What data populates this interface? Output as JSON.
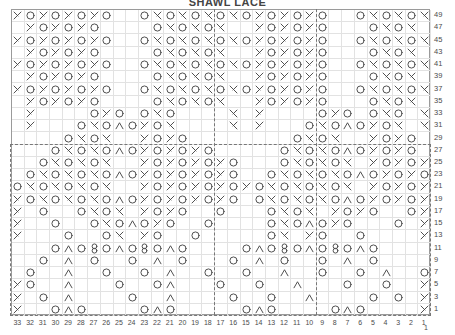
{
  "chart_title": "SHAWL LACE",
  "legend_symbols": {
    "yo": "o",
    "k2tog": "\\",
    "ssk": "/",
    "cdd": "^",
    "double-dec": "Q",
    "blank": ""
  },
  "axes": {
    "row_numbers": [
      49,
      47,
      45,
      43,
      41,
      39,
      37,
      35,
      33,
      31,
      29,
      27,
      25,
      23,
      21,
      19,
      17,
      15,
      13,
      11,
      9,
      7,
      5,
      3,
      1
    ],
    "column_numbers": [
      33,
      32,
      31,
      30,
      29,
      28,
      27,
      26,
      25,
      24,
      23,
      22,
      21,
      20,
      19,
      18,
      17,
      16,
      15,
      14,
      13,
      12,
      11,
      10,
      9,
      8,
      7,
      6,
      5,
      4,
      3,
      2,
      1
    ],
    "extra_label": "1",
    "row_count": 25,
    "column_count": 33
  },
  "chart_data": {
    "type": "table",
    "title": "SHAWL LACE",
    "xlabel": "Stitch number",
    "ylabel": "Row number",
    "grid": true,
    "legend_position": "none",
    "rows": [
      {
        "row": 49,
        "cells": [
          "/",
          "o",
          "/",
          "o",
          "/",
          "o",
          "/",
          "o",
          "",
          "",
          "o",
          "\\",
          "o",
          "\\",
          "o",
          "\\",
          "o",
          "\\",
          "o",
          "/",
          "o",
          "/",
          "o",
          "/",
          "o",
          "",
          "",
          "o",
          "\\",
          "o",
          "\\",
          "o",
          "\\"
        ]
      },
      {
        "row": 47,
        "cells": [
          "",
          "/",
          "o",
          "/",
          "o",
          "/",
          "o",
          "",
          "",
          "",
          "",
          "o",
          "\\",
          "o",
          "\\",
          "o",
          "\\",
          "",
          "",
          "/",
          "o",
          "/",
          "o",
          "/",
          "o",
          "",
          "",
          "",
          "o",
          "\\",
          "o",
          "\\",
          ""
        ]
      },
      {
        "row": 45,
        "cells": [
          "/",
          "o",
          "/",
          "o",
          "/",
          "o",
          "/",
          "o",
          "",
          "",
          "o",
          "\\",
          "o",
          "\\",
          "o",
          "\\",
          "o",
          "\\",
          "o",
          "/",
          "o",
          "/",
          "o",
          "/",
          "o",
          "",
          "",
          "o",
          "\\",
          "o",
          "\\",
          "o",
          "\\"
        ]
      },
      {
        "row": 43,
        "cells": [
          "",
          "/",
          "o",
          "/",
          "o",
          "/",
          "o",
          "",
          "",
          "",
          "",
          "o",
          "\\",
          "o",
          "\\",
          "o",
          "\\",
          "",
          "",
          "/",
          "o",
          "/",
          "o",
          "/",
          "o",
          "",
          "",
          "",
          "o",
          "\\",
          "o",
          "\\",
          ""
        ]
      },
      {
        "row": 41,
        "cells": [
          "/",
          "o",
          "/",
          "o",
          "/",
          "o",
          "/",
          "o",
          "",
          "",
          "o",
          "\\",
          "o",
          "\\",
          "o",
          "\\",
          "o",
          "\\",
          "o",
          "/",
          "o",
          "/",
          "o",
          "/",
          "o",
          "",
          "",
          "o",
          "\\",
          "o",
          "\\",
          "o",
          "\\"
        ]
      },
      {
        "row": 39,
        "cells": [
          "",
          "/",
          "o",
          "/",
          "o",
          "/",
          "o",
          "",
          "",
          "",
          "",
          "o",
          "\\",
          "o",
          "\\",
          "o",
          "\\",
          "",
          "",
          "/",
          "o",
          "/",
          "o",
          "/",
          "o",
          "",
          "",
          "",
          "o",
          "\\",
          "o",
          "\\",
          ""
        ]
      },
      {
        "row": 37,
        "cells": [
          "/",
          "o",
          "/",
          "o",
          "/",
          "o",
          "/",
          "o",
          "",
          "",
          "o",
          "\\",
          "o",
          "\\",
          "o",
          "\\",
          "o",
          "\\",
          "o",
          "/",
          "o",
          "/",
          "o",
          "/",
          "o",
          "",
          "",
          "o",
          "\\",
          "o",
          "\\",
          "o",
          "\\"
        ]
      },
      {
        "row": 35,
        "cells": [
          "",
          "/",
          "o",
          "/",
          "o",
          "/",
          "o",
          "",
          "",
          "",
          "",
          "o",
          "\\",
          "o",
          "\\",
          "o",
          "\\",
          "",
          "",
          "/",
          "o",
          "/",
          "o",
          "/",
          "o",
          "",
          "",
          "",
          "o",
          "\\",
          "o",
          "\\",
          ""
        ]
      },
      {
        "row": 33,
        "cells": [
          "",
          "/",
          "",
          "",
          "",
          "",
          "o",
          "/",
          "o",
          "",
          "o",
          "\\",
          "o",
          "",
          "",
          "",
          "",
          "\\",
          "",
          "/",
          "",
          "",
          "",
          "",
          "o",
          "/",
          "o",
          "",
          "o",
          "\\",
          "o",
          "",
          "\\"
        ]
      },
      {
        "row": 31,
        "cells": [
          "",
          "/",
          "",
          "",
          "",
          "o",
          "\\",
          "o",
          "^",
          "o",
          "/",
          "o",
          "\\",
          "",
          "",
          "",
          "",
          "\\",
          "",
          "/",
          "",
          "",
          "",
          "o",
          "\\",
          "o",
          "^",
          "o",
          "/",
          "o",
          "\\",
          "",
          "\\"
        ]
      },
      {
        "row": 29,
        "cells": [
          "",
          "",
          "",
          "",
          "o",
          "\\",
          "o",
          "\\",
          "",
          "",
          "/",
          "o",
          "/",
          "o",
          "",
          "",
          "",
          "",
          "",
          "",
          "",
          "",
          "o",
          "\\",
          "o",
          "\\",
          "",
          "",
          "/",
          "o",
          "/",
          "o",
          ""
        ]
      },
      {
        "row": 27,
        "cells": [
          "",
          "",
          "",
          "o",
          "\\",
          "o",
          "\\",
          "o",
          "^",
          "o",
          "/",
          "o",
          "/",
          "o",
          "/",
          "o",
          "",
          "",
          "",
          "",
          "",
          "o",
          "\\",
          "o",
          "\\",
          "o",
          "^",
          "o",
          "/",
          "o",
          "/",
          "o",
          ""
        ]
      },
      {
        "row": 25,
        "cells": [
          "",
          "",
          "o",
          "\\",
          "o",
          "\\",
          "o",
          "\\",
          "",
          "",
          "/",
          "o",
          "/",
          "o",
          "/",
          "o",
          "/",
          "o",
          "",
          "",
          "",
          "o",
          "\\",
          "o",
          "\\",
          "o",
          "\\",
          "",
          "/",
          "o",
          "/",
          "o",
          "/"
        ]
      },
      {
        "row": 23,
        "cells": [
          "",
          "o",
          "\\",
          "o",
          "\\",
          "o",
          "\\",
          "o",
          "^",
          "o",
          "/",
          "o",
          "/",
          "o",
          "/",
          "o",
          "/",
          "o",
          "",
          "",
          "o",
          "\\",
          "o",
          "\\",
          "o",
          "\\",
          "o",
          "^",
          "o",
          "/",
          "o",
          "/",
          "o"
        ]
      },
      {
        "row": 21,
        "cells": [
          "o",
          "\\",
          "o",
          "\\",
          "o",
          "\\",
          "o",
          "\\",
          "",
          "",
          "/",
          "o",
          "/",
          "o",
          "/",
          "o",
          "/",
          "o",
          "/",
          "o",
          "\\",
          "o",
          "\\",
          "o",
          "\\",
          "o",
          "\\",
          "",
          "/",
          "o",
          "/",
          "o",
          "/"
        ]
      },
      {
        "row": 19,
        "cells": [
          "/",
          "o",
          "\\",
          "o",
          "\\",
          "o",
          "\\",
          "o",
          "^",
          "o",
          "/",
          "o",
          "/",
          "o",
          "/",
          "o",
          "/",
          "o",
          "",
          "o",
          "\\",
          "o",
          "\\",
          "o",
          "\\",
          "o",
          "^",
          "o",
          "/",
          "o",
          "/",
          "o",
          "/"
        ]
      },
      {
        "row": 17,
        "cells": [
          "/",
          "",
          "o",
          "",
          "",
          "o",
          "\\",
          "o",
          "\\",
          "",
          "/",
          "o",
          "/",
          "o",
          "",
          "",
          "o",
          "",
          "",
          "",
          "o",
          "\\",
          "o",
          "\\",
          "",
          "/",
          "o",
          "/",
          "o",
          "",
          "",
          "o",
          "/"
        ]
      },
      {
        "row": 15,
        "cells": [
          "/",
          "",
          "",
          "o",
          "",
          "",
          "o",
          "\\",
          "o",
          "^",
          "o",
          "/",
          "o",
          "",
          "",
          "o",
          "",
          "",
          "",
          "",
          "o",
          "\\",
          "o",
          "^",
          "o",
          "/",
          "o",
          "",
          "",
          "",
          "o",
          "",
          "/"
        ]
      },
      {
        "row": 13,
        "cells": [
          "/",
          "",
          "",
          "",
          "o",
          "",
          "",
          "o",
          "\\",
          "",
          "/",
          "o",
          "",
          "",
          "o",
          "",
          "",
          "",
          "",
          "",
          "o",
          "\\",
          "",
          "/",
          "o",
          "",
          "",
          "o",
          "",
          "",
          "",
          "",
          "/"
        ]
      },
      {
        "row": 11,
        "cells": [
          "",
          "",
          "",
          "o",
          "^",
          "o",
          "Q",
          "o",
          "^",
          "o",
          "Q",
          "o",
          "^",
          "o",
          "",
          "",
          "",
          "",
          "o",
          "^",
          "o",
          "Q",
          "o",
          "^",
          "o",
          "Q",
          "o",
          "^",
          "o",
          "",
          "",
          "",
          ""
        ]
      },
      {
        "row": 9,
        "cells": [
          "",
          "",
          "o",
          "",
          "^",
          "",
          "o",
          "",
          "",
          "o",
          "",
          "^",
          "",
          "o",
          "",
          "",
          "",
          "o",
          "",
          "^",
          "",
          "o",
          "",
          "",
          "o",
          "",
          "^",
          "",
          "o",
          "",
          "",
          "",
          ""
        ]
      },
      {
        "row": 7,
        "cells": [
          "",
          "o",
          "",
          "",
          "^",
          "",
          "",
          "o",
          "",
          "",
          "o",
          "",
          "^",
          "",
          "",
          "o",
          "",
          "",
          "o",
          "",
          "",
          "^",
          "",
          "",
          "o",
          "",
          "",
          "o",
          "",
          "^",
          "",
          "",
          "o"
        ]
      },
      {
        "row": 5,
        "cells": [
          "/",
          "o",
          "",
          "",
          "^",
          "",
          "",
          "",
          "o",
          "",
          "",
          "o",
          "^",
          "",
          "",
          "",
          "o",
          "",
          "",
          "o",
          "",
          "",
          "^",
          "",
          "",
          "",
          "o",
          "",
          "",
          "o",
          "",
          "",
          "/"
        ]
      },
      {
        "row": 3,
        "cells": [
          "/",
          "",
          "o",
          "",
          "^",
          "",
          "",
          "",
          "",
          "o",
          "",
          "",
          "^",
          "",
          "",
          "",
          "",
          "o",
          "",
          "",
          "o",
          "",
          "",
          "^",
          "",
          "",
          "",
          "",
          "o",
          "",
          "o",
          "",
          "/"
        ]
      },
      {
        "row": 1,
        "cells": [
          "/",
          "",
          "",
          "o",
          "^",
          "o",
          "",
          "",
          "",
          "",
          "o",
          "^",
          "o",
          "",
          "",
          "",
          "",
          "",
          "o",
          "^",
          "o",
          "",
          "",
          "",
          "",
          "o",
          "^",
          "o",
          "",
          "",
          "",
          "",
          "/"
        ]
      }
    ]
  },
  "repeat_guides": {
    "vertical_lines": [
      16,
      24
    ],
    "horizontal_line_after_row": 11,
    "description": "Dashed lines mark the pattern repeat boundaries"
  }
}
